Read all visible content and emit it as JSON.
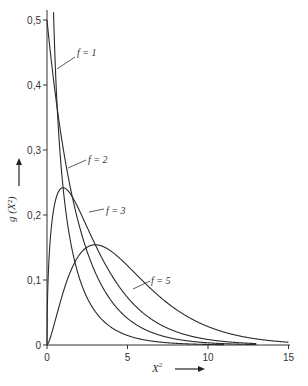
{
  "chart_data": {
    "type": "line",
    "title": "",
    "xlabel": "X²",
    "ylabel": "g(X²)",
    "xlim": [
      0,
      15
    ],
    "ylim": [
      0,
      0.5
    ],
    "x_ticks": [
      "0",
      "5",
      "10",
      "15"
    ],
    "y_ticks": [
      "0",
      "0,1",
      "0,2",
      "0,3",
      "0,4",
      "0,5"
    ],
    "grid": false,
    "legend": "inline labels",
    "series": [
      {
        "name": "f = 1",
        "peak": "→∞ at X²→0",
        "values_at_x": {
          "0.5": 0.439,
          "1": 0.242,
          "2": 0.104,
          "4": 0.027,
          "8": 0.0025
        }
      },
      {
        "name": "f = 2",
        "peak": 0.5,
        "values_at_x": {
          "0": 0.5,
          "1": 0.303,
          "2": 0.184,
          "4": 0.068,
          "8": 0.009,
          "10": 0.003
        }
      },
      {
        "name": "f = 3",
        "peak": 0.242,
        "peak_x": 1,
        "values_at_x": {
          "0": 0,
          "1": 0.242,
          "2": 0.208,
          "4": 0.108,
          "8": 0.021,
          "12": 0.003
        }
      },
      {
        "name": "f = 5",
        "peak": 0.154,
        "peak_x": 3,
        "values_at_x": {
          "0": 0,
          "1": 0.081,
          "3": 0.154,
          "5": 0.122,
          "8": 0.055,
          "10": 0.028,
          "15": 0.003
        }
      }
    ]
  },
  "labels": {
    "f1": "f = 1",
    "f2": "f = 2",
    "f3": "f = 3",
    "f5": "f = 5",
    "xaxis": "X",
    "xaxis_sup": "2",
    "yaxis": "g (X²)"
  }
}
